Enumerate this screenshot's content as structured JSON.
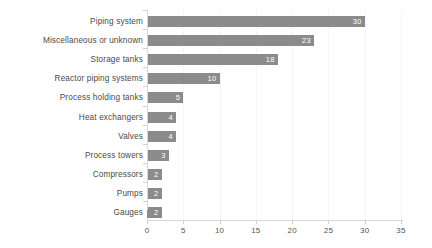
{
  "chart_data": {
    "type": "bar",
    "orientation": "horizontal",
    "title": "",
    "xlabel": "",
    "ylabel": "",
    "xlim": [
      0,
      35
    ],
    "xticks": [
      "0",
      "5",
      "10",
      "15",
      "20",
      "25",
      "30",
      "35"
    ],
    "grid": true,
    "legend": false,
    "bar_color": "#8b8b8b",
    "label_color": "#4a4a4a",
    "value_label_color": "#ffffff",
    "categories": [
      "Piping system",
      "Miscellaneous or unknown",
      "Storage tanks",
      "Reactor piping systems",
      "Process holding tanks",
      "Heat exchangers",
      "Valves",
      "Process towers",
      "Compressors",
      "Pumps",
      "Gauges"
    ],
    "values": [
      30,
      23,
      18,
      10,
      5,
      4,
      4,
      3,
      2,
      2,
      2
    ],
    "value_labels": [
      "30",
      "23",
      "18",
      "10",
      "5",
      "4",
      "4",
      "3",
      "2",
      "2",
      "2"
    ]
  }
}
